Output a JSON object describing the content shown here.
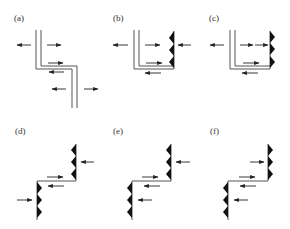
{
  "figure": {
    "panels": [
      {
        "id": "a",
        "label": "(a)",
        "boundary": "double-line step (open crack)",
        "teeth": "none"
      },
      {
        "id": "b",
        "label": "(b)",
        "boundary": "double-line left wall, toothed right wall",
        "teeth": "right wall, pointing left"
      },
      {
        "id": "c",
        "label": "(c)",
        "boundary": "double-line left wall, toothed right wall",
        "teeth": "right wall, pointing right"
      },
      {
        "id": "d",
        "label": "(d)",
        "boundary": "stepped single line",
        "teeth": "upper: pointing left; lower: pointing right"
      },
      {
        "id": "e",
        "label": "(e)",
        "boundary": "stepped single line",
        "teeth": "upper: pointing left; lower: pointing left"
      },
      {
        "id": "f",
        "label": "(f)",
        "boundary": "stepped single line",
        "teeth": "upper: pointing right; lower: pointing left"
      }
    ]
  },
  "colors": {
    "line": "#555555",
    "teeth": "#111111",
    "arrow": "#222222"
  }
}
